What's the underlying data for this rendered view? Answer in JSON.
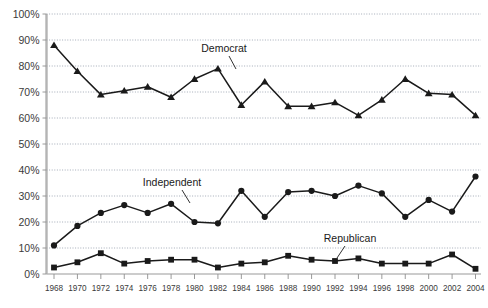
{
  "chart_data": {
    "type": "line",
    "title": "",
    "subtitle": "",
    "xlabel": "",
    "ylabel": "",
    "xlim": [
      1968,
      2004
    ],
    "ylim": [
      0,
      100
    ],
    "grid": true,
    "grid_axis": "y",
    "legend_position": "inline-annotations",
    "y_tick_labels": [
      "0%",
      "10%",
      "20%",
      "30%",
      "40%",
      "50%",
      "60%",
      "70%",
      "80%",
      "90%",
      "100%"
    ],
    "y_tick_values": [
      0,
      10,
      20,
      30,
      40,
      50,
      60,
      70,
      80,
      90,
      100
    ],
    "categories": [
      1968,
      1970,
      1972,
      1974,
      1976,
      1978,
      1980,
      1982,
      1984,
      1986,
      1988,
      1990,
      1992,
      1994,
      1996,
      1998,
      2000,
      2002,
      2004
    ],
    "x_tick_labels": [
      "1968",
      "1970",
      "1972",
      "1974",
      "1976",
      "1978",
      "1980",
      "1982",
      "1984",
      "1986",
      "1988",
      "1990",
      "1992",
      "1994",
      "1996",
      "1998",
      "2000",
      "2002",
      "2004"
    ],
    "series": [
      {
        "name": "Democrat",
        "marker": "triangle",
        "color": "#1a1a1a",
        "values": [
          88,
          78,
          69,
          70.5,
          72,
          68,
          75,
          79,
          65,
          74,
          64.5,
          64.5,
          66,
          61,
          67,
          75,
          69.5,
          69,
          61
        ]
      },
      {
        "name": "Independent",
        "marker": "circle",
        "color": "#1a1a1a",
        "values": [
          11,
          18.5,
          23.5,
          26.5,
          23.5,
          27,
          20,
          19.5,
          32,
          22,
          31.5,
          32,
          30,
          34,
          31,
          22,
          28.5,
          24,
          37.5
        ]
      },
      {
        "name": "Republican",
        "marker": "square",
        "color": "#1a1a1a",
        "values": [
          2.5,
          4.5,
          8,
          4,
          5,
          5.5,
          5.5,
          2.5,
          4,
          4.5,
          7,
          5.5,
          5,
          6,
          4,
          4,
          4,
          7.5,
          2
        ]
      }
    ],
    "annotations": [
      {
        "text": "Democrat",
        "label_x": 224,
        "label_y": 52,
        "leader_x1": 229,
        "leader_y1": 56,
        "leader_x2": 236,
        "leader_y2": 69
      },
      {
        "text": "Independent",
        "label_x": 172,
        "label_y": 186,
        "leader_x1": 182,
        "leader_y1": 190,
        "leader_x2": 190,
        "leader_y2": 203
      },
      {
        "text": "Republican",
        "label_x": 350,
        "label_y": 242,
        "leader_x1": 345,
        "leader_y1": 246,
        "leader_x2": 337,
        "leader_y2": 258
      }
    ],
    "colors": {
      "line": "#1a1a1a",
      "gridline": "#9aa3b0",
      "axis": "#9a9a9a",
      "tick_text": "#3a3a3a",
      "background": "#ffffff"
    }
  }
}
